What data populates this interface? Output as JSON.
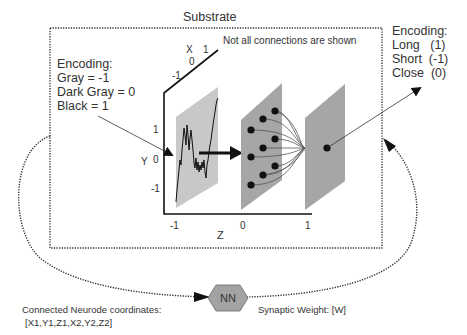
{
  "substrate": {
    "title": "Substrate",
    "note": "Not all connections are shown"
  },
  "input_encoding": {
    "heading": "Encoding:",
    "lines": [
      "Gray = -1",
      "Dark Gray = 0",
      "Black = 1"
    ]
  },
  "output_encoding": {
    "heading": "Encoding:",
    "lines": [
      "Long   (1)",
      "Short  (-1)",
      "Close  (0)"
    ]
  },
  "axes": {
    "x": {
      "label": "X",
      "ticks": [
        "-1",
        "0",
        "1"
      ]
    },
    "y": {
      "label": "Y",
      "ticks": [
        "1",
        "0",
        "-1"
      ]
    },
    "z": {
      "label": "Z",
      "ticks": [
        "-1",
        "0",
        "1"
      ]
    }
  },
  "layers": {
    "input": {
      "fill": "#c8c8c8"
    },
    "hidden": {
      "fill": "#a6a6a6",
      "neurode_count": 9
    },
    "output": {
      "fill": "#a6a6a6",
      "neurode_count": 1
    }
  },
  "network": {
    "node_label": "NN",
    "node_fill": "#a3a3a3",
    "input_label_line1": "Connected Neurode coordinates:",
    "input_label_line2": "[X1,Y1,Z1,X2,Y2,Z2]",
    "output_label": "Synaptic Weight: [W]"
  }
}
